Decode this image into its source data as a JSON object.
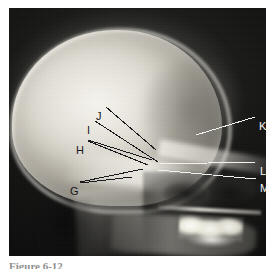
{
  "figure": {
    "type": "radiograph",
    "modality": "x-ray",
    "view": "lateral skull radiograph (infant/pediatric)",
    "caption_fragment": "Figure 6-12"
  },
  "image_frame": {
    "left": 9,
    "top": 8,
    "width": 257,
    "height": 248,
    "background_color": "#0b0b0b",
    "page_background": "#ffffff"
  },
  "annotations": {
    "label_color_dark": "#16161a",
    "label_color_light": "#f4f4f2",
    "leader_color_dark": "#1a1a1e",
    "leader_color_light": "#f2f2f0",
    "items": [
      {
        "id": "G",
        "label": "G",
        "text_x": 70,
        "text_y": 186,
        "side": "left",
        "color": "dark",
        "leaders": [
          {
            "x1": 80,
            "y1": 182,
            "x2": 143,
            "y2": 169
          },
          {
            "x1": 80,
            "y1": 183,
            "x2": 132,
            "y2": 177
          }
        ]
      },
      {
        "id": "H",
        "label": "H",
        "text_x": 76,
        "text_y": 145,
        "side": "left",
        "color": "dark",
        "leaders": [
          {
            "x1": 88,
            "y1": 140,
            "x2": 152,
            "y2": 160
          },
          {
            "x1": 88,
            "y1": 141,
            "x2": 148,
            "y2": 165
          }
        ]
      },
      {
        "id": "I",
        "label": "I",
        "text_x": 87,
        "text_y": 125,
        "side": "left",
        "color": "dark",
        "leaders": [
          {
            "x1": 95,
            "y1": 121,
            "x2": 158,
            "y2": 162
          }
        ]
      },
      {
        "id": "J",
        "label": "J",
        "text_x": 96,
        "text_y": 111,
        "side": "left",
        "color": "dark",
        "leaders": [
          {
            "x1": 106,
            "y1": 107,
            "x2": 156,
            "y2": 150
          }
        ]
      },
      {
        "id": "K",
        "label": "K",
        "text_x": 259,
        "text_y": 121,
        "side": "right",
        "color": "light",
        "leaders": [
          {
            "x1": 255,
            "y1": 117,
            "x2": 196,
            "y2": 135
          }
        ]
      },
      {
        "id": "L",
        "label": "L",
        "text_x": 260,
        "text_y": 166,
        "side": "right",
        "color": "light",
        "leaders": [
          {
            "x1": 256,
            "y1": 162,
            "x2": 160,
            "y2": 164
          }
        ]
      },
      {
        "id": "M",
        "label": "M",
        "text_x": 260,
        "text_y": 183,
        "side": "right",
        "color": "light",
        "leaders": [
          {
            "x1": 256,
            "y1": 179,
            "x2": 158,
            "y2": 170
          }
        ]
      }
    ]
  }
}
